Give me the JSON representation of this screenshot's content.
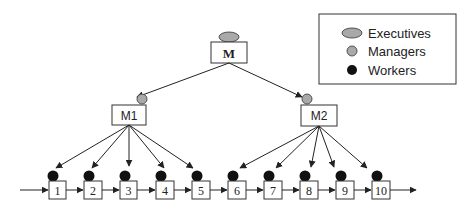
{
  "legend": {
    "items": [
      {
        "label": "Executives",
        "shape": "ellipse",
        "color": "#a9a9a9"
      },
      {
        "label": "Managers",
        "shape": "circle",
        "color": "#a9a9a9"
      },
      {
        "label": "Workers",
        "shape": "circle",
        "color": "#111111"
      }
    ]
  },
  "executive": {
    "label": "M"
  },
  "managers": [
    {
      "label": "M1"
    },
    {
      "label": "M2"
    }
  ],
  "workers": [
    {
      "label": "1"
    },
    {
      "label": "2"
    },
    {
      "label": "3"
    },
    {
      "label": "4"
    },
    {
      "label": "5"
    },
    {
      "label": "6"
    },
    {
      "label": "7"
    },
    {
      "label": "8"
    },
    {
      "label": "9"
    },
    {
      "label": "10"
    }
  ],
  "colors": {
    "stroke": "#222222",
    "executive_fill": "#a9a9a9",
    "manager_fill": "#a9a9a9",
    "worker_fill": "#111111"
  }
}
